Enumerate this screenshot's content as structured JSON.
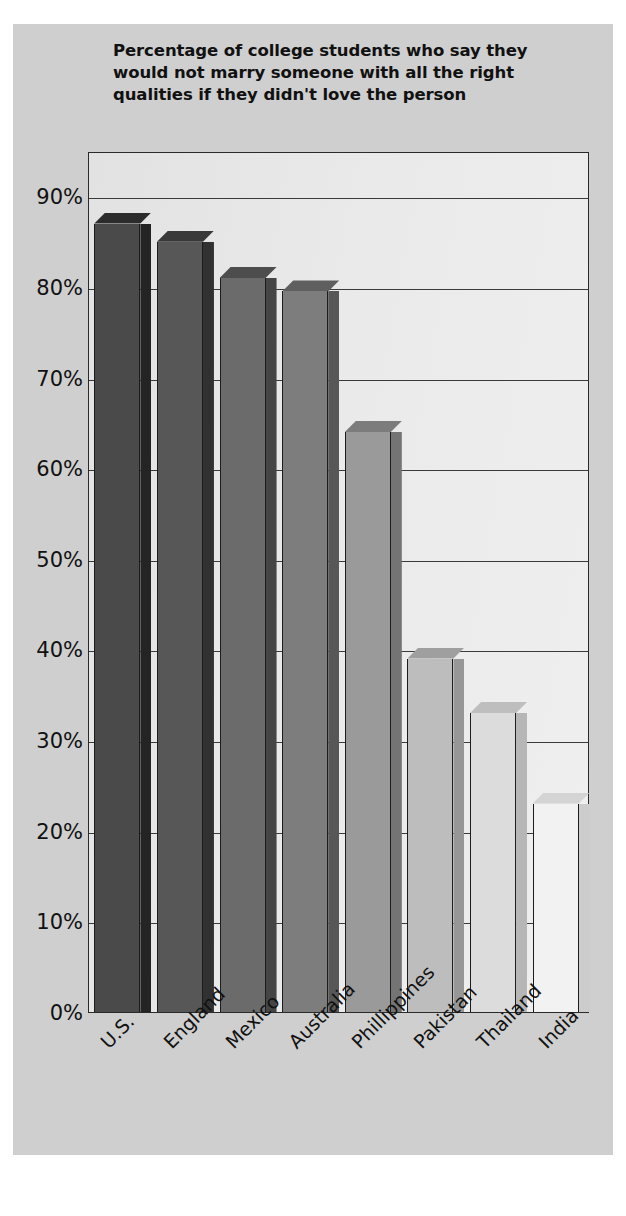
{
  "title": "Percentage of college students who say they would not marry someone with all the right qualities if they didn't love the person",
  "chart_data": {
    "type": "bar",
    "title": "Percentage of college students who say they would not marry someone with all the right qualities if they didn't love the person",
    "xlabel": "",
    "ylabel": "",
    "categories": [
      "U.S.",
      "England",
      "Mexico",
      "Australia",
      "Phillippines",
      "Pakistan",
      "Thailand",
      "India"
    ],
    "values": [
      87,
      85,
      81,
      79.5,
      64,
      39,
      33,
      23
    ],
    "ylim": [
      0,
      95
    ],
    "yticks": [
      0,
      10,
      20,
      30,
      40,
      50,
      60,
      70,
      80,
      90
    ],
    "ytick_labels": [
      "0%",
      "10%",
      "20%",
      "30%",
      "40%",
      "50%",
      "60%",
      "70%",
      "80%",
      "90%"
    ],
    "grid": true,
    "legend": "none",
    "bar_colors": [
      "#4a4a4a",
      "#575757",
      "#6b6b6b",
      "#7d7d7d",
      "#9a9a9a",
      "#bdbdbd",
      "#dcdcdc",
      "#f2f2f2"
    ],
    "style": "3d-bar",
    "plot_background": "#e9e9e9",
    "panel_background": "#cfcfcf",
    "axis_color": "#2a2a2a"
  }
}
